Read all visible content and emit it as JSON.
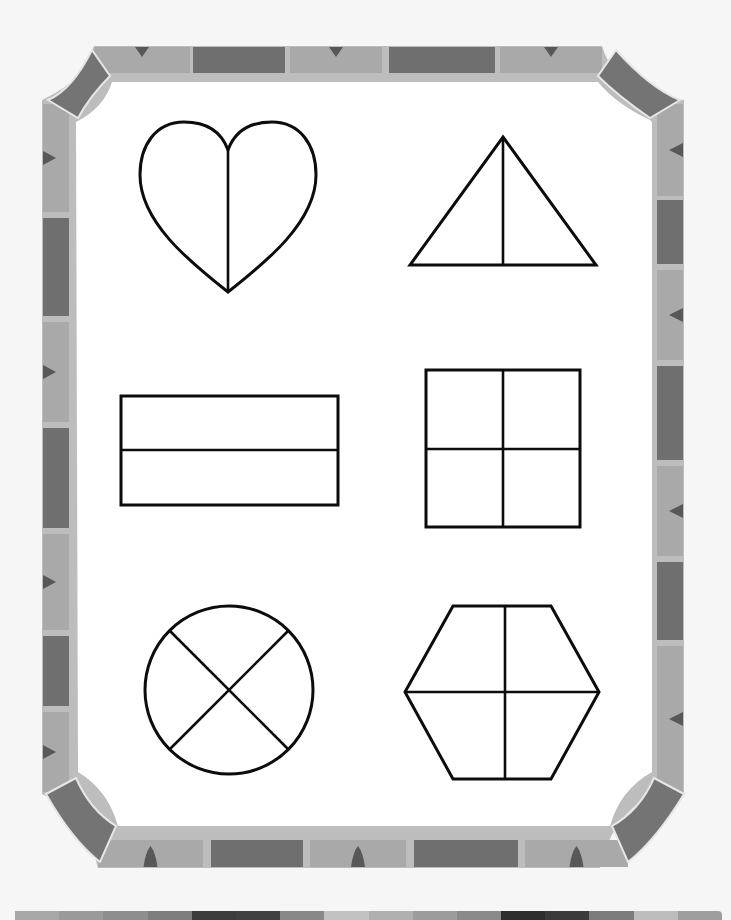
{
  "worksheet": {
    "title": "Fraction shapes worksheet",
    "border": {
      "colors": {
        "frame_inner": "#bdbdbd",
        "tile_light": "#a9a9a9",
        "tile_dark": "#6f6f6f",
        "corner": "#747474",
        "separator": "#e6e6e6",
        "triangle": "#585858",
        "paper": "#ffffff"
      },
      "top_tiles": [
        {
          "x": 94,
          "w": 96,
          "tone": "light",
          "marker": true
        },
        {
          "x": 193,
          "w": 92,
          "tone": "dark",
          "marker": false
        },
        {
          "x": 290,
          "w": 92,
          "tone": "light",
          "marker": true
        },
        {
          "x": 389,
          "w": 106,
          "tone": "dark",
          "marker": false
        },
        {
          "x": 500,
          "w": 102,
          "tone": "light",
          "marker": true
        }
      ],
      "bottom_tiles": [
        {
          "x": 98,
          "w": 105,
          "tone": "light",
          "marker": true
        },
        {
          "x": 211,
          "w": 92,
          "tone": "dark",
          "marker": false
        },
        {
          "x": 310,
          "w": 96,
          "tone": "light",
          "marker": true
        },
        {
          "x": 414,
          "w": 104,
          "tone": "dark",
          "marker": false
        },
        {
          "x": 525,
          "w": 103,
          "tone": "light",
          "marker": true
        }
      ],
      "left_tiles": [
        {
          "y": 104,
          "h": 108,
          "tone": "light",
          "marker": true
        },
        {
          "y": 218,
          "h": 98,
          "tone": "dark",
          "marker": false
        },
        {
          "y": 322,
          "h": 100,
          "tone": "light",
          "marker": true
        },
        {
          "y": 428,
          "h": 100,
          "tone": "dark",
          "marker": false
        },
        {
          "y": 534,
          "h": 96,
          "tone": "light",
          "marker": true
        },
        {
          "y": 636,
          "h": 70,
          "tone": "dark",
          "marker": false
        },
        {
          "y": 712,
          "h": 80,
          "tone": "light",
          "marker": true
        }
      ],
      "right_tiles": [
        {
          "y": 104,
          "h": 92,
          "tone": "light",
          "marker": true
        },
        {
          "y": 200,
          "h": 64,
          "tone": "dark",
          "marker": false
        },
        {
          "y": 270,
          "h": 90,
          "tone": "light",
          "marker": true
        },
        {
          "y": 366,
          "h": 94,
          "tone": "dark",
          "marker": false
        },
        {
          "y": 466,
          "h": 90,
          "tone": "light",
          "marker": true
        },
        {
          "y": 562,
          "h": 78,
          "tone": "dark",
          "marker": false
        },
        {
          "y": 646,
          "h": 146,
          "tone": "light",
          "marker": true
        }
      ]
    },
    "shapes": [
      {
        "id": "heart",
        "label": "Heart divided into halves",
        "parts": 2
      },
      {
        "id": "triangle",
        "label": "Triangle divided into halves",
        "parts": 2
      },
      {
        "id": "rectangle",
        "label": "Rectangle divided into halves",
        "parts": 2
      },
      {
        "id": "square",
        "label": "Square divided into fourths",
        "parts": 4
      },
      {
        "id": "circle",
        "label": "Circle divided into fourths",
        "parts": 4
      },
      {
        "id": "hexagon",
        "label": "Hexagon divided into fourths",
        "parts": 4
      }
    ],
    "calibration_strip": [
      "#a8a8a8",
      "#9a9a9a",
      "#8e8e8e",
      "#7d7d7d",
      "#3c3c3c",
      "#404040",
      "#888888",
      "#c2c2c2",
      "#b0b0b0",
      "#9c9c9c",
      "#8a8a8a",
      "#2e2e2e",
      "#3a3a3a",
      "#7c7c7c",
      "#bdbdbd",
      "#9e9e9e"
    ]
  }
}
